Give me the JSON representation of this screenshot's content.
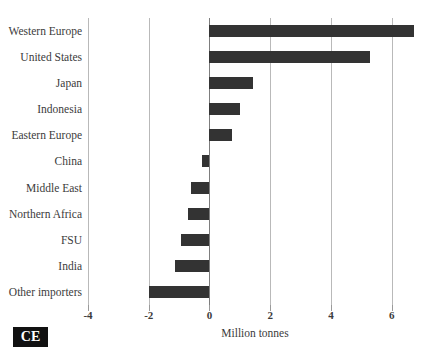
{
  "chart_data": {
    "type": "bar",
    "orientation": "horizontal",
    "title": "",
    "subtitle": "",
    "xlabel": "Million tonnes",
    "ylabel": "",
    "xlim": [
      -4,
      7
    ],
    "xticks": [
      -4,
      -2,
      0,
      2,
      4,
      6
    ],
    "xtick_labels": [
      "-4",
      "-2",
      "0",
      "2",
      "4",
      "6"
    ],
    "grid": "vertical",
    "legend": "none",
    "bar_color": "#333333",
    "gridline_color": "#b9b9b9",
    "zero_line_color": "#7d7d7d",
    "categories": [
      "Western Europe",
      "United States",
      "Japan",
      "Indonesia",
      "Eastern Europe",
      "China",
      "Middle East",
      "Northern Africa",
      "FSU",
      "India",
      "Other importers"
    ],
    "values": [
      6.75,
      5.3,
      1.45,
      1.0,
      0.75,
      -0.25,
      -0.6,
      -0.7,
      -0.95,
      -1.15,
      -2.0
    ],
    "series": [
      {
        "name": "Net trade",
        "values": [
          6.75,
          5.3,
          1.45,
          1.0,
          0.75,
          -0.25,
          -0.6,
          -0.7,
          -0.95,
          -1.15,
          -2.0
        ]
      }
    ]
  },
  "footer": {
    "logo_text": "CE",
    "source_caption": ""
  }
}
